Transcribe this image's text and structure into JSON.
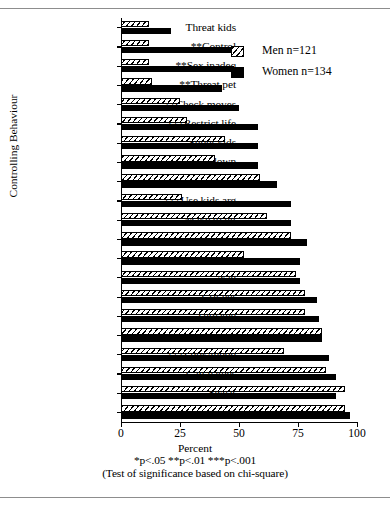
{
  "chart_data": {
    "type": "bar",
    "orientation": "horizontal",
    "title": "",
    "xlabel": "Percent",
    "ylabel": "Controlling Behaviour",
    "xlim": [
      0,
      100
    ],
    "xticks": [
      0,
      25,
      50,
      75,
      100
    ],
    "xtick_labels": [
      "0",
      "25",
      "50",
      "75",
      "100"
    ],
    "grid": false,
    "legend_position": "upper right",
    "categories": [
      "Threat kids",
      "**Control",
      "**Sex inadeq",
      "**Threat pet",
      "**Check moves",
      "***Restrict life",
      "Shout kids",
      "Put her down",
      "Point",
      "***Use kids arg",
      "Make to hit",
      "Question her",
      "Provoke arg",
      "Nag",
      "Crit her",
      "Threaten",
      "Crit fam",
      "***Look/mood",
      "Call names",
      "Swear",
      "Shout"
    ],
    "series": [
      {
        "name": "Men n=121",
        "fill": "hatched",
        "values": [
          12,
          12,
          12,
          13,
          25,
          28,
          44,
          40,
          59,
          26,
          62,
          72,
          52,
          74,
          78,
          78,
          85,
          69,
          87,
          95,
          95
        ]
      },
      {
        "name": "Women n=134",
        "fill": "solid-black",
        "values": [
          21,
          48,
          48,
          43,
          50,
          58,
          58,
          58,
          66,
          72,
          72,
          79,
          76,
          76,
          83,
          84,
          85,
          88,
          91,
          91,
          97
        ]
      }
    ],
    "annotations": [
      "*p<.05 **p<.01 ***p<.001",
      "(Test of significance based on chi-square)"
    ]
  },
  "legend": {
    "items": [
      {
        "label": "Men n=121",
        "swatch": "hatched-square-icon"
      },
      {
        "label": "Women n=134",
        "swatch": "filled-square-icon"
      }
    ]
  },
  "axes": {
    "x_title": "Percent",
    "y_title": "Controlling Behaviour"
  },
  "footnote": {
    "line1": "*p<.05 **p<.01 ***p<.001",
    "line2": "(Test of significance based on chi-square)"
  },
  "colors": {
    "ink": "#000000",
    "paper": "#ffffff",
    "scan_edge": "#8d8d8d"
  }
}
